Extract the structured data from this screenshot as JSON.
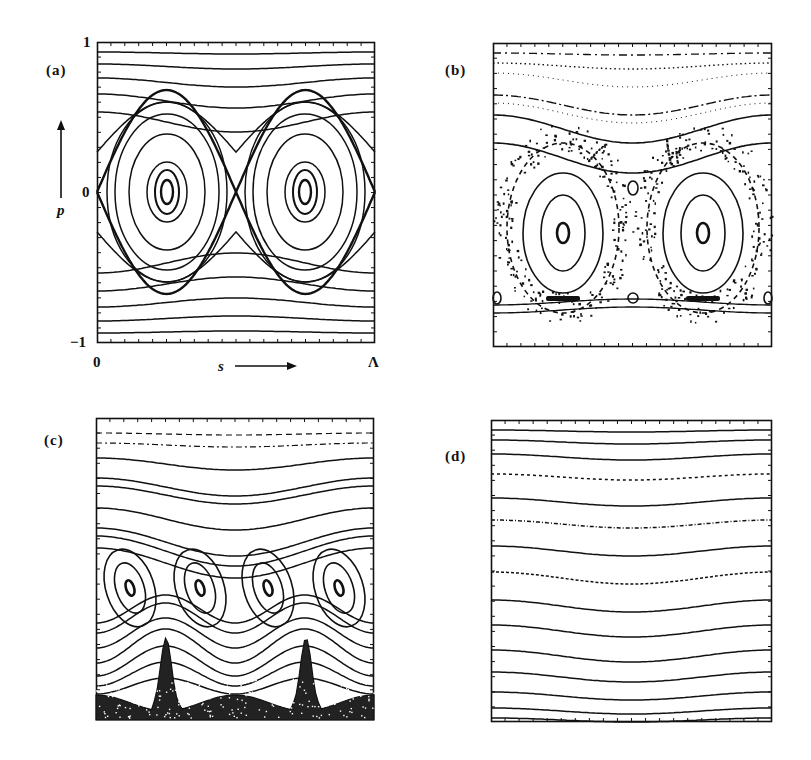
{
  "figure": {
    "panels": [
      {
        "id": "a",
        "label": "(a)"
      },
      {
        "id": "b",
        "label": "(b)"
      },
      {
        "id": "c",
        "label": "(c)"
      },
      {
        "id": "d",
        "label": "(d)"
      }
    ],
    "axes_a": {
      "y_top": "1",
      "y_mid": "0",
      "y_bottom": "−1",
      "y_label": "p",
      "x_left": "0",
      "x_label": "s",
      "x_right": "Λ"
    }
  },
  "chart_data": [
    {
      "panel": "a",
      "type": "phase-portrait",
      "description": "Integrable pendulum-like phase space: two island chains (elliptic fixed points at s=Λ/4 and 3Λ/4, p=0) bounded by a separatrix through hyperbolic point at s=Λ/2, with rotational (passing) orbits above and below",
      "xlabel": "s",
      "ylabel": "p",
      "xlim": [
        0,
        "Λ"
      ],
      "ylim": [
        -1,
        1
      ],
      "islands": 2
    },
    {
      "panel": "b",
      "type": "phase-portrait",
      "description": "Perturbed: two main islands shifted below p=0, chaotic layer around separatrix, small secondary islands, dotted/broken KAM curves near top",
      "islands": 2
    },
    {
      "panel": "c",
      "type": "phase-portrait",
      "description": "Four tilted islands in a chain in lower half, chaotic sea at bottom, rotational orbits above",
      "islands": 4
    },
    {
      "panel": "d",
      "type": "phase-portrait",
      "description": "Only rotational (passing) orbits: wavy horizontal invariant curves dipping at center, no islands",
      "islands": 0
    }
  ]
}
